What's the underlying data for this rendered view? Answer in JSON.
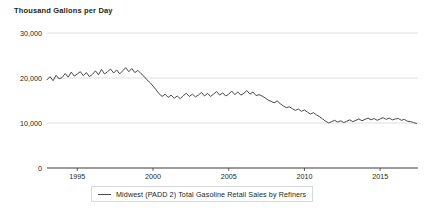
{
  "chart_data": {
    "type": "line",
    "title": "Thousand Gallons per Day",
    "ylabel": "Thousand Gallons per Day",
    "xlabel": "",
    "grid": true,
    "legend_position": "bottom",
    "xlim": [
      1993.0,
      2017.5
    ],
    "ylim": [
      0,
      30000
    ],
    "ytick_labels": [
      "0",
      "10,000",
      "20,000",
      "30,000"
    ],
    "ytick_values": [
      0,
      10000,
      20000,
      30000
    ],
    "xtick_labels": [
      "1995",
      "2000",
      "2005",
      "2010",
      "2015"
    ],
    "xtick_values": [
      1995,
      2000,
      2005,
      2010,
      2015
    ],
    "series": [
      {
        "name": "Midwest (PADD 2) Total Gasoline Retail Sales by Refiners",
        "color": "#4a4a4a",
        "x": [
          1993.0,
          1993.2,
          1993.4,
          1993.6,
          1993.8,
          1994.0,
          1994.2,
          1994.4,
          1994.6,
          1994.8,
          1995.0,
          1995.2,
          1995.4,
          1995.6,
          1995.8,
          1996.0,
          1996.2,
          1996.4,
          1996.6,
          1996.8,
          1997.0,
          1997.2,
          1997.4,
          1997.6,
          1997.8,
          1998.0,
          1998.2,
          1998.4,
          1998.6,
          1998.8,
          1999.0,
          1999.2,
          1999.4,
          1999.6,
          1999.8,
          2000.0,
          2000.2,
          2000.4,
          2000.6,
          2000.8,
          2001.0,
          2001.2,
          2001.4,
          2001.6,
          2001.8,
          2002.0,
          2002.2,
          2002.4,
          2002.6,
          2002.8,
          2003.0,
          2003.2,
          2003.4,
          2003.6,
          2003.8,
          2004.0,
          2004.2,
          2004.4,
          2004.6,
          2004.8,
          2005.0,
          2005.2,
          2005.4,
          2005.6,
          2005.8,
          2006.0,
          2006.2,
          2006.4,
          2006.6,
          2006.8,
          2007.0,
          2007.2,
          2007.4,
          2007.6,
          2007.8,
          2008.0,
          2008.2,
          2008.4,
          2008.6,
          2008.8,
          2009.0,
          2009.2,
          2009.4,
          2009.6,
          2009.8,
          2010.0,
          2010.2,
          2010.4,
          2010.6,
          2010.8,
          2011.0,
          2011.2,
          2011.4,
          2011.6,
          2011.8,
          2012.0,
          2012.2,
          2012.4,
          2012.6,
          2012.8,
          2013.0,
          2013.2,
          2013.4,
          2013.6,
          2013.8,
          2014.0,
          2014.2,
          2014.4,
          2014.6,
          2014.8,
          2015.0,
          2015.2,
          2015.4,
          2015.6,
          2015.8,
          2016.0,
          2016.2,
          2016.4,
          2016.6,
          2016.8,
          2017.0,
          2017.2,
          2017.4
        ],
        "values": [
          19600,
          20300,
          19400,
          20600,
          19800,
          20100,
          21000,
          20200,
          21300,
          20400,
          20900,
          21400,
          20500,
          21200,
          20300,
          20800,
          21600,
          20700,
          21900,
          20900,
          21400,
          22000,
          21100,
          21800,
          20900,
          21600,
          22300,
          21400,
          22100,
          21200,
          21700,
          21000,
          20400,
          19600,
          19000,
          18200,
          17400,
          16500,
          15900,
          16400,
          15700,
          16200,
          15500,
          16000,
          15400,
          16100,
          16600,
          15900,
          16400,
          15800,
          16200,
          16800,
          16000,
          16600,
          15900,
          16400,
          17000,
          16200,
          16700,
          16000,
          16400,
          17100,
          16300,
          16900,
          16200,
          16600,
          17200,
          16400,
          16900,
          16100,
          16300,
          16000,
          15600,
          15100,
          14800,
          14500,
          14900,
          14300,
          13800,
          13400,
          13600,
          13200,
          12800,
          13100,
          12600,
          12900,
          12400,
          12000,
          12300,
          11800,
          11400,
          10900,
          10400,
          10000,
          10300,
          10600,
          10200,
          10500,
          10100,
          10400,
          10700,
          10300,
          10600,
          10900,
          10500,
          10800,
          11100,
          10700,
          11000,
          10600,
          10900,
          11200,
          10800,
          11100,
          10700,
          10900,
          11000,
          10600,
          10800,
          10400,
          10300,
          10100,
          9900
        ]
      }
    ]
  },
  "legend": {
    "label": "Midwest (PADD 2) Total Gasoline Retail Sales by Refiners"
  }
}
